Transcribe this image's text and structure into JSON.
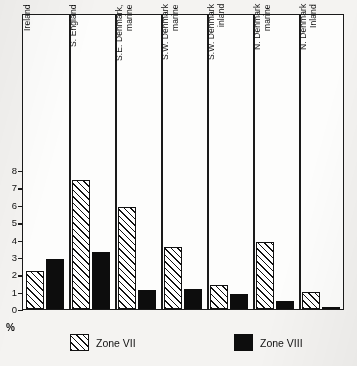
{
  "chart_data": {
    "type": "bar",
    "title": "",
    "xlabel": "",
    "ylabel": "%",
    "ylim": [
      0,
      8
    ],
    "yticks": [
      0,
      1,
      2,
      3,
      4,
      5,
      6,
      7,
      8
    ],
    "ytick_labels": [
      "0",
      "1",
      "2",
      "3",
      "4",
      "5",
      "6",
      "7",
      "8"
    ],
    "grid": false,
    "legend_position": "bottom",
    "categories": [
      "Ireland",
      "S. England",
      "S.E. Denmark,\nmarine",
      "S.W. Denmark\nmarine",
      "S.W. Denmark\ninland",
      "N. Denmark\nmarine",
      "N. Denmark\nInland"
    ],
    "series": [
      {
        "name": "Zone VII",
        "fill": "hatched",
        "values": [
          2.2,
          7.4,
          5.9,
          3.55,
          1.4,
          3.85,
          1.0
        ]
      },
      {
        "name": "Zone VIII",
        "fill": "solid-black",
        "values": [
          2.85,
          3.3,
          1.1,
          1.15,
          0.85,
          0.45,
          0.07
        ]
      }
    ]
  },
  "axis": {
    "unit_label": "%"
  },
  "legend": {
    "items": [
      {
        "label": "Zone VII",
        "swatch": "hatched-swatch"
      },
      {
        "label": "Zone VIII",
        "swatch": "solid-black-swatch"
      }
    ]
  },
  "colors": {
    "ink": "#111111",
    "paper": "#fdfdfc",
    "page": "#f4f3f1"
  }
}
